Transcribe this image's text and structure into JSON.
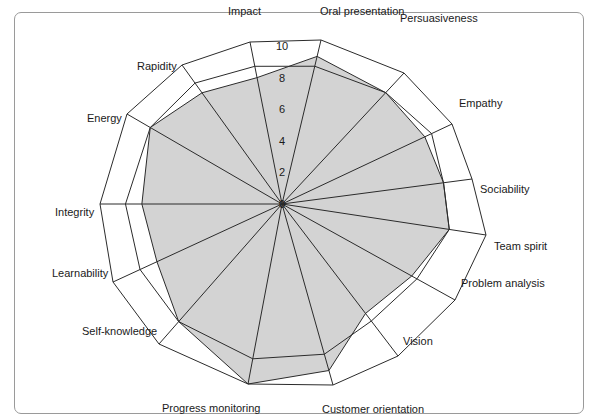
{
  "chart_data": {
    "type": "radar",
    "title": "",
    "center": [
      282,
      204
    ],
    "rmax": 10,
    "ticks": [
      "0",
      "2",
      "4",
      "6",
      "8",
      "10"
    ],
    "tick_axis": "Impact",
    "categories": [
      "Impact",
      "Oral presentation",
      "Persuasiveness",
      "Empathy",
      "Sociability",
      "Team spirit",
      "Problem analysis",
      "Vision",
      "Customer orientation",
      "Progress monitoring",
      "Self-knowledge",
      "Learnability",
      "Integrity",
      "Energy",
      "Rapidity"
    ],
    "axis_outer_points": [
      [
        250,
        42
      ],
      [
        321,
        40
      ],
      [
        404,
        73
      ],
      [
        452,
        124
      ],
      [
        472,
        179
      ],
      [
        486,
        235
      ],
      [
        455,
        300
      ],
      [
        398,
        356
      ],
      [
        333,
        385
      ],
      [
        248,
        384
      ],
      [
        159,
        344
      ],
      [
        113,
        282
      ],
      [
        100,
        204
      ],
      [
        127,
        114
      ],
      [
        182,
        65
      ]
    ],
    "series": [
      {
        "name": "Reference",
        "filled": false,
        "values": [
          8.5,
          8.4,
          8.5,
          8.8,
          8.5,
          8.2,
          7.8,
          7.7,
          8.3,
          8.6,
          8.4,
          8.4,
          8.6,
          8.5,
          8.7
        ]
      },
      {
        "name": "Score",
        "filled": true,
        "fill": "#d3d3d3",
        "values": [
          7.8,
          9.0,
          8.5,
          8.4,
          8.5,
          8.2,
          7.5,
          7.2,
          9.2,
          10.0,
          8.4,
          7.4,
          7.7,
          8.5,
          8.0
        ]
      }
    ],
    "label_positions": [
      [
        228,
        5,
        "start"
      ],
      [
        320,
        5,
        "start"
      ],
      [
        400,
        12,
        "start"
      ],
      [
        459,
        97,
        "start"
      ],
      [
        480,
        183,
        "start"
      ],
      [
        494,
        240,
        "start"
      ],
      [
        461,
        277,
        "start"
      ],
      [
        403,
        335,
        "start"
      ],
      [
        322,
        403,
        "start"
      ],
      [
        162,
        402,
        "start"
      ],
      [
        82,
        325,
        "start"
      ],
      [
        52,
        267,
        "start"
      ],
      [
        55,
        206,
        "start"
      ],
      [
        87,
        112,
        "start"
      ],
      [
        137,
        60,
        "start"
      ]
    ],
    "colors": {
      "grid": "#2b2b2b",
      "fill": "#d3d3d3",
      "frame": "#9a9a9a",
      "text": "#1a1a1a"
    }
  }
}
